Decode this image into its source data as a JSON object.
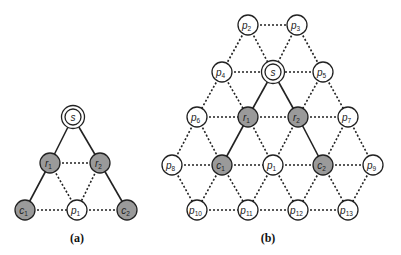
{
  "diagrams": [
    {
      "id": "a",
      "caption": "(a)",
      "caption_pos": [
        77,
        242
      ],
      "nodes": [
        {
          "id": "s",
          "label": "s",
          "sub": "",
          "x": 73,
          "y": 117,
          "style": "source"
        },
        {
          "id": "r1",
          "label": "r",
          "sub": "1",
          "x": 50,
          "y": 163,
          "style": "gray"
        },
        {
          "id": "r2",
          "label": "r",
          "sub": "2",
          "x": 100,
          "y": 163,
          "style": "gray"
        },
        {
          "id": "c1",
          "label": "c",
          "sub": "1",
          "x": 25,
          "y": 210,
          "style": "gray"
        },
        {
          "id": "p1",
          "label": "p",
          "sub": "1",
          "x": 77,
          "y": 210,
          "style": "white"
        },
        {
          "id": "c2",
          "label": "c",
          "sub": "2",
          "x": 127,
          "y": 210,
          "style": "gray"
        }
      ],
      "edges": [
        {
          "from": "s",
          "to": "r1",
          "type": "solid"
        },
        {
          "from": "s",
          "to": "r2",
          "type": "solid"
        },
        {
          "from": "r1",
          "to": "c1",
          "type": "solid"
        },
        {
          "from": "r2",
          "to": "c2",
          "type": "solid"
        },
        {
          "from": "r1",
          "to": "r2",
          "type": "dashed"
        },
        {
          "from": "r1",
          "to": "p1",
          "type": "dashed"
        },
        {
          "from": "r2",
          "to": "p1",
          "type": "dashed"
        },
        {
          "from": "c1",
          "to": "p1",
          "type": "dashed"
        },
        {
          "from": "p1",
          "to": "c2",
          "type": "dashed"
        }
      ]
    },
    {
      "id": "b",
      "caption": "(b)",
      "caption_pos": [
        268,
        242
      ],
      "nodes": [
        {
          "id": "p2",
          "label": "p",
          "sub": "2",
          "x": 248,
          "y": 25,
          "style": "white"
        },
        {
          "id": "p3",
          "label": "p",
          "sub": "3",
          "x": 297,
          "y": 25,
          "style": "white"
        },
        {
          "id": "p4",
          "label": "p",
          "sub": "4",
          "x": 222,
          "y": 72,
          "style": "white"
        },
        {
          "id": "s",
          "label": "s",
          "sub": "",
          "x": 273,
          "y": 72,
          "style": "source"
        },
        {
          "id": "p5",
          "label": "p",
          "sub": "5",
          "x": 323,
          "y": 72,
          "style": "white"
        },
        {
          "id": "p6",
          "label": "p",
          "sub": "6",
          "x": 197,
          "y": 117,
          "style": "white"
        },
        {
          "id": "r1",
          "label": "r",
          "sub": "1",
          "x": 248,
          "y": 117,
          "style": "gray"
        },
        {
          "id": "r2",
          "label": "r",
          "sub": "2",
          "x": 298,
          "y": 117,
          "style": "gray"
        },
        {
          "id": "p7",
          "label": "p",
          "sub": "7",
          "x": 348,
          "y": 117,
          "style": "white"
        },
        {
          "id": "p8",
          "label": "p",
          "sub": "8",
          "x": 172,
          "y": 165,
          "style": "white"
        },
        {
          "id": "c1",
          "label": "c",
          "sub": "1",
          "x": 222,
          "y": 165,
          "style": "gray"
        },
        {
          "id": "p1",
          "label": "p",
          "sub": "1",
          "x": 273,
          "y": 165,
          "style": "white"
        },
        {
          "id": "c2",
          "label": "c",
          "sub": "2",
          "x": 323,
          "y": 165,
          "style": "gray"
        },
        {
          "id": "p9",
          "label": "p",
          "sub": "9",
          "x": 373,
          "y": 165,
          "style": "white"
        },
        {
          "id": "p10",
          "label": "p",
          "sub": "10",
          "x": 197,
          "y": 210,
          "style": "white"
        },
        {
          "id": "p11",
          "label": "p",
          "sub": "11",
          "x": 248,
          "y": 210,
          "style": "white"
        },
        {
          "id": "p12",
          "label": "p",
          "sub": "12",
          "x": 298,
          "y": 210,
          "style": "white"
        },
        {
          "id": "p13",
          "label": "p",
          "sub": "13",
          "x": 348,
          "y": 210,
          "style": "white"
        }
      ],
      "edges": [
        {
          "from": "s",
          "to": "r1",
          "type": "solid"
        },
        {
          "from": "s",
          "to": "r2",
          "type": "solid"
        },
        {
          "from": "r1",
          "to": "c1",
          "type": "solid"
        },
        {
          "from": "r2",
          "to": "c2",
          "type": "solid"
        },
        {
          "from": "p2",
          "to": "p3",
          "type": "dashed"
        },
        {
          "from": "p2",
          "to": "p4",
          "type": "dashed"
        },
        {
          "from": "p2",
          "to": "s",
          "type": "dashed"
        },
        {
          "from": "p3",
          "to": "s",
          "type": "dashed"
        },
        {
          "from": "p3",
          "to": "p5",
          "type": "dashed"
        },
        {
          "from": "p4",
          "to": "s",
          "type": "dashed"
        },
        {
          "from": "s",
          "to": "p5",
          "type": "dashed"
        },
        {
          "from": "p4",
          "to": "p6",
          "type": "dashed"
        },
        {
          "from": "p4",
          "to": "r1",
          "type": "dashed"
        },
        {
          "from": "p5",
          "to": "r2",
          "type": "dashed"
        },
        {
          "from": "p5",
          "to": "p7",
          "type": "dashed"
        },
        {
          "from": "p6",
          "to": "r1",
          "type": "dashed"
        },
        {
          "from": "r1",
          "to": "r2",
          "type": "dashed"
        },
        {
          "from": "r2",
          "to": "p7",
          "type": "dashed"
        },
        {
          "from": "p6",
          "to": "p8",
          "type": "dashed"
        },
        {
          "from": "p6",
          "to": "c1",
          "type": "dashed"
        },
        {
          "from": "r1",
          "to": "p1",
          "type": "dashed"
        },
        {
          "from": "r2",
          "to": "p1",
          "type": "dashed"
        },
        {
          "from": "p7",
          "to": "c2",
          "type": "dashed"
        },
        {
          "from": "p7",
          "to": "p9",
          "type": "dashed"
        },
        {
          "from": "p8",
          "to": "c1",
          "type": "dashed"
        },
        {
          "from": "c1",
          "to": "p1",
          "type": "dashed"
        },
        {
          "from": "p1",
          "to": "c2",
          "type": "dashed"
        },
        {
          "from": "c2",
          "to": "p9",
          "type": "dashed"
        },
        {
          "from": "p8",
          "to": "p10",
          "type": "dashed"
        },
        {
          "from": "c1",
          "to": "p10",
          "type": "dashed"
        },
        {
          "from": "c1",
          "to": "p11",
          "type": "dashed"
        },
        {
          "from": "p1",
          "to": "p11",
          "type": "dashed"
        },
        {
          "from": "p1",
          "to": "p12",
          "type": "dashed"
        },
        {
          "from": "c2",
          "to": "p12",
          "type": "dashed"
        },
        {
          "from": "c2",
          "to": "p13",
          "type": "dashed"
        },
        {
          "from": "p9",
          "to": "p13",
          "type": "dashed"
        },
        {
          "from": "p10",
          "to": "p11",
          "type": "dashed"
        },
        {
          "from": "p11",
          "to": "p12",
          "type": "dashed"
        },
        {
          "from": "p12",
          "to": "p13",
          "type": "dashed"
        }
      ]
    }
  ],
  "colors": {
    "gray_node": "#9a9a9a",
    "white_node": "#ffffff",
    "stroke": "#222222"
  },
  "node_radius": 10
}
